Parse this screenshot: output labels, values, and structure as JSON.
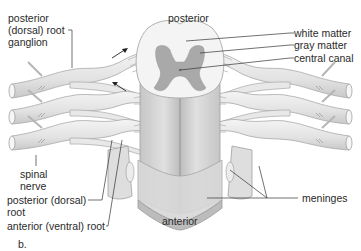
{
  "figure": {
    "panel_label": "b.",
    "orientation": {
      "top": "posterior",
      "bottom": "anterior"
    },
    "labels": {
      "posterior_root_ganglion": "posterior\n(dorsal) root\nganglion",
      "white_matter": "white matter",
      "gray_matter": "gray matter",
      "central_canal": "central canal",
      "spinal_nerve": "spinal\nnerve",
      "posterior_root": "posterior (dorsal)\nroot",
      "anterior_root": "anterior (ventral) root",
      "meninges": "meninges"
    },
    "colors": {
      "nerve_fill": "#e6e6e6",
      "nerve_stroke": "#a8a8a8",
      "white_matter": "#f2f2f2",
      "gray_matter": "#a9a9a9",
      "cord_body": "#d4d4d4",
      "meninges": "#bcbcbc",
      "leader_line": "#333333",
      "text": "#2a2a2a"
    }
  }
}
